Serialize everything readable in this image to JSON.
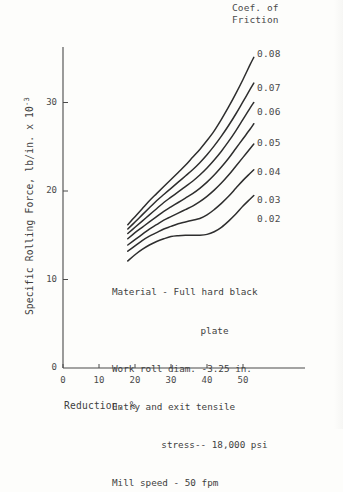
{
  "chart_data": {
    "type": "line",
    "title": "",
    "xlabel": "Reduction, %",
    "ylabel": "Specific Rolling Force, lb/in. x 10",
    "ylabel_exponent": "-3",
    "xlim": [
      0,
      60
    ],
    "ylim": [
      0,
      36
    ],
    "xticks": [
      0,
      10,
      20,
      30,
      40,
      50
    ],
    "xtick_labels": [
      "0",
      "10",
      "20",
      "30",
      "40",
      "50"
    ],
    "yticks": [
      0,
      10,
      20,
      30
    ],
    "ytick_labels": [
      "0",
      "10",
      "20",
      "30"
    ],
    "grid": false,
    "legend_position": "right-of-curves",
    "legend_title": "Coef. of\nFriction",
    "series": [
      {
        "name": "0.08",
        "label": "0.08",
        "x": [
          18,
          20,
          22,
          24,
          26,
          28,
          30,
          32,
          34,
          36,
          38,
          40,
          42,
          44,
          46,
          48,
          50,
          52,
          53
        ],
        "y": [
          16.2,
          17.1,
          18.0,
          18.9,
          19.7,
          20.5,
          21.3,
          22.1,
          22.9,
          23.8,
          24.7,
          25.7,
          26.8,
          28.1,
          29.5,
          31.0,
          32.6,
          34.3,
          35.1
        ]
      },
      {
        "name": "0.07",
        "label": "0.07",
        "x": [
          18,
          20,
          22,
          24,
          26,
          28,
          30,
          32,
          34,
          36,
          38,
          40,
          42,
          44,
          46,
          48,
          50,
          52,
          53
        ],
        "y": [
          15.7,
          16.5,
          17.3,
          18.1,
          18.9,
          19.6,
          20.3,
          21.0,
          21.7,
          22.4,
          23.2,
          24.1,
          25.1,
          26.2,
          27.4,
          28.7,
          30.1,
          31.5,
          32.2
        ]
      },
      {
        "name": "0.06",
        "label": "0.06",
        "x": [
          18,
          20,
          22,
          24,
          26,
          28,
          30,
          32,
          34,
          36,
          38,
          40,
          42,
          44,
          46,
          48,
          50,
          52,
          53
        ],
        "y": [
          15.2,
          15.9,
          16.6,
          17.3,
          18.0,
          18.7,
          19.3,
          19.9,
          20.5,
          21.1,
          21.8,
          22.6,
          23.5,
          24.5,
          25.6,
          26.8,
          28.1,
          29.4,
          30.0
        ]
      },
      {
        "name": "0.05",
        "label": "0.05",
        "x": [
          18,
          20,
          22,
          24,
          26,
          28,
          30,
          32,
          34,
          36,
          38,
          40,
          42,
          44,
          46,
          48,
          50,
          52,
          53
        ],
        "y": [
          14.6,
          15.3,
          15.9,
          16.5,
          17.1,
          17.7,
          18.2,
          18.7,
          19.2,
          19.7,
          20.3,
          21.0,
          21.8,
          22.7,
          23.7,
          24.8,
          25.9,
          27.0,
          27.6
        ]
      },
      {
        "name": "0.04",
        "label": "0.04",
        "x": [
          18,
          20,
          22,
          24,
          26,
          28,
          30,
          32,
          34,
          36,
          38,
          40,
          42,
          44,
          46,
          48,
          50,
          52,
          53
        ],
        "y": [
          13.9,
          14.5,
          15.1,
          15.7,
          16.2,
          16.7,
          17.1,
          17.5,
          17.9,
          18.3,
          18.8,
          19.4,
          20.1,
          20.9,
          21.8,
          22.8,
          23.8,
          24.8,
          25.3
        ]
      },
      {
        "name": "0.03",
        "label": "0.03",
        "x": [
          18,
          20,
          22,
          24,
          26,
          28,
          30,
          32,
          34,
          36,
          38,
          40,
          42,
          44,
          46,
          48,
          50,
          52,
          53
        ],
        "y": [
          13.2,
          13.8,
          14.4,
          14.9,
          15.3,
          15.7,
          16.0,
          16.3,
          16.5,
          16.7,
          16.9,
          17.3,
          17.9,
          18.6,
          19.4,
          20.3,
          21.2,
          22.0,
          22.4
        ]
      },
      {
        "name": "0.02",
        "label": "0.02",
        "x": [
          18,
          20,
          22,
          24,
          26,
          28,
          30,
          32,
          34,
          36,
          38,
          40,
          42,
          44,
          46,
          48,
          50,
          52,
          53
        ],
        "y": [
          12.1,
          12.8,
          13.4,
          13.9,
          14.3,
          14.6,
          14.85,
          14.95,
          15.0,
          15.0,
          15.0,
          15.1,
          15.4,
          15.9,
          16.6,
          17.4,
          18.3,
          19.1,
          19.5
        ]
      }
    ],
    "annotations": [
      "Material - Full hard black",
      "plate",
      "Work roll diam. -3.25 in.",
      "Entry and exit tensile",
      "stress-- 18,000 psi",
      "Mill speed - 50 fpm"
    ],
    "colors": {
      "curve": "#2e2e2e",
      "axis": "#4a4a4a",
      "text": "#3f3f3f",
      "background": "#fdfdfb"
    }
  },
  "legend": {
    "title_line1": "Coef. of",
    "title_line2": "Friction",
    "labels": [
      "0.08",
      "0.07",
      "0.06",
      "0.05",
      "0.04",
      "0.03",
      "0.02"
    ]
  },
  "axes": {
    "x_label": "Reduction, %",
    "y_label_main": "Specific Rolling Force, lb/in. x 10",
    "y_label_exp": "-3",
    "x_tick_labels": [
      "0",
      "10",
      "20",
      "30",
      "40",
      "50"
    ],
    "y_tick_labels": [
      "0",
      "10",
      "20",
      "30"
    ]
  },
  "annotation_block": {
    "line1": "Material - Full hard black",
    "line2": "plate",
    "line3": "Work roll diam. -3.25 in.",
    "line4": "Entry and exit tensile",
    "line5": "stress-- 18,000 psi",
    "line6": "Mill speed - 50 fpm"
  }
}
